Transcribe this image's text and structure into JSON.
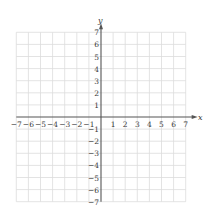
{
  "chart_data": {
    "type": "coordinate-grid",
    "title": "",
    "xlabel": "x",
    "ylabel": "y",
    "xlim": [
      -7,
      7
    ],
    "ylim": [
      -7,
      7
    ],
    "grid": true,
    "x_ticks": [
      -7,
      -6,
      -5,
      -4,
      -3,
      -2,
      -1,
      1,
      2,
      3,
      4,
      5,
      6,
      7
    ],
    "y_ticks": [
      -7,
      -6,
      -5,
      -4,
      -3,
      -2,
      -1,
      1,
      2,
      3,
      4,
      5,
      6,
      7
    ],
    "x_tick_labels": [
      "−7",
      "−6",
      "−5",
      "−4",
      "−3",
      "−2",
      "−1",
      "1",
      "2",
      "3",
      "4",
      "5",
      "6",
      "7"
    ],
    "y_tick_labels": [
      "−7",
      "−6",
      "−5",
      "−4",
      "−3",
      "−2",
      "−1",
      "1",
      "2",
      "3",
      "4",
      "5",
      "6",
      "7"
    ],
    "series": []
  },
  "colors": {
    "grid": "#dcdcdc",
    "axis": "#555555",
    "label": "#3a3a3a"
  }
}
